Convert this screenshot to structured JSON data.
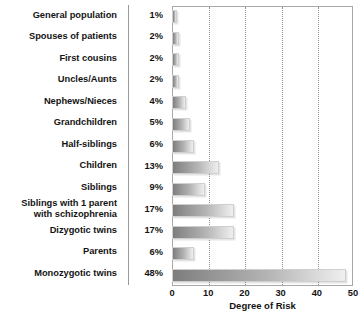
{
  "chart_data": {
    "type": "bar",
    "orientation": "horizontal",
    "title": "",
    "xlabel": "Degree of Risk",
    "ylabel": "",
    "xlim": [
      0,
      50
    ],
    "xticks": [
      0,
      10,
      20,
      30,
      40,
      50
    ],
    "xtick_labels": [
      "0",
      "10",
      "20",
      "30",
      "40",
      "50"
    ],
    "gridlines": [
      10,
      20,
      30,
      40
    ],
    "grid": true,
    "legend": "none",
    "categories": [
      "General population",
      "Spouses of patients",
      "First cousins",
      "Uncles/Aunts",
      "Nephews/Nieces",
      "Grandchildren",
      "Half-siblings",
      "Children",
      "Siblings",
      "Siblings with 1 parent\nwith schizophrenia",
      "Dizygotic twins",
      "Parents",
      "Monozygotic twins"
    ],
    "values": [
      1,
      2,
      2,
      2,
      4,
      5,
      6,
      13,
      9,
      17,
      17,
      6,
      48
    ],
    "value_labels": [
      "1%",
      "2%",
      "2%",
      "2%",
      "4%",
      "5%",
      "6%",
      "13%",
      "9%",
      "17%",
      "17%",
      "6%",
      "48%"
    ],
    "colors": {
      "bar_gradient_start": "#7d7d7d",
      "bar_gradient_end": "#efefef",
      "bar_border": "#cfcfcf",
      "plot_border": "#a8a8a8",
      "gridline": "#8f8f8f",
      "text": "#141414",
      "background": "#ffffff"
    }
  }
}
